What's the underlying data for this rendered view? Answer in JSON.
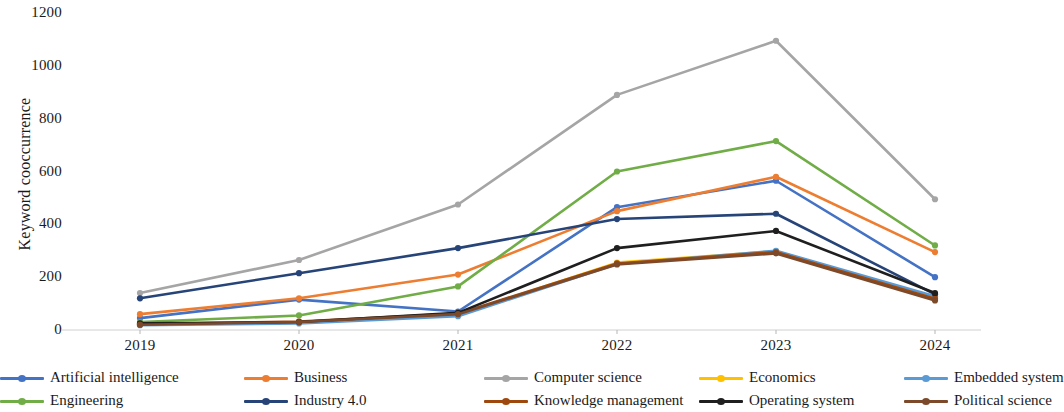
{
  "chart_data": {
    "type": "line",
    "title": "",
    "xlabel": "",
    "ylabel": "Keyword cooccurrence",
    "categories": [
      "2019",
      "2020",
      "2021",
      "2022",
      "2023",
      "2024"
    ],
    "ylim": [
      0,
      1200
    ],
    "yticks": [
      0,
      200,
      400,
      600,
      800,
      1000,
      1200
    ],
    "ytick_labels": [
      "0",
      "200",
      "400",
      "600",
      "800",
      "1000",
      "1200"
    ],
    "grid": false,
    "legend_position": "bottom",
    "markers": "circle",
    "series": [
      {
        "name": "Artificial intelligence",
        "color": "#4472C4",
        "values": [
          45,
          115,
          70,
          465,
          565,
          200
        ]
      },
      {
        "name": "Business",
        "color": "#ED7D31",
        "values": [
          60,
          120,
          210,
          450,
          580,
          295
        ]
      },
      {
        "name": "Computer science",
        "color": "#A5A5A5",
        "values": [
          140,
          265,
          475,
          890,
          1095,
          495
        ]
      },
      {
        "name": "Economics",
        "color": "#FFC000",
        "values": [
          20,
          28,
          58,
          255,
          298,
          122
        ]
      },
      {
        "name": "Embedded system",
        "color": "#5B9BD5",
        "values": [
          18,
          25,
          52,
          250,
          300,
          128
        ]
      },
      {
        "name": "Engineering",
        "color": "#70AD47",
        "values": [
          30,
          55,
          165,
          600,
          715,
          320
        ]
      },
      {
        "name": "Industry 4.0",
        "color": "#264478",
        "values": [
          120,
          215,
          310,
          420,
          440,
          135
        ]
      },
      {
        "name": "Knowledge management",
        "color": "#9E480E",
        "values": [
          22,
          32,
          62,
          252,
          295,
          118
        ]
      },
      {
        "name": "Operating system",
        "color": "#1F1F1F",
        "values": [
          25,
          30,
          65,
          310,
          375,
          140
        ]
      },
      {
        "name": "Political science",
        "color": "#7C4A2B",
        "values": [
          20,
          30,
          60,
          248,
          290,
          112
        ]
      }
    ]
  },
  "legend": {
    "items": [
      {
        "label": "Artificial intelligence",
        "color": "#4472C4"
      },
      {
        "label": "Business",
        "color": "#ED7D31"
      },
      {
        "label": "Computer science",
        "color": "#A5A5A5"
      },
      {
        "label": "Economics",
        "color": "#FFC000"
      },
      {
        "label": "Embedded system",
        "color": "#5B9BD5"
      },
      {
        "label": "Engineering",
        "color": "#70AD47"
      },
      {
        "label": "Industry 4.0",
        "color": "#264478"
      },
      {
        "label": "Knowledge management",
        "color": "#9E480E"
      },
      {
        "label": "Operating system",
        "color": "#1F1F1F"
      },
      {
        "label": "Political science",
        "color": "#7C4A2B"
      }
    ]
  }
}
